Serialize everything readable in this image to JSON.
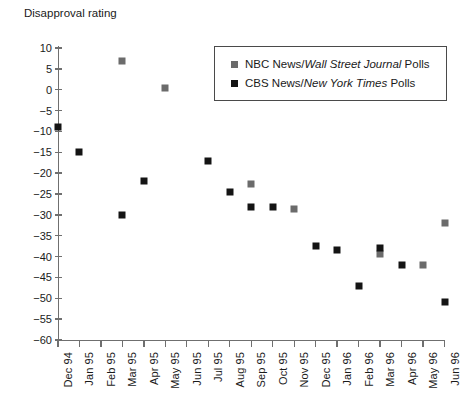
{
  "chart_data": {
    "type": "scatter",
    "title": "Disapproval rating",
    "xlabel": "",
    "ylabel": "Disapproval rating",
    "ylim": [
      -60,
      10
    ],
    "ytick_step": 5,
    "yticks": [
      10,
      5,
      0,
      -5,
      -10,
      -15,
      -20,
      -25,
      -30,
      -35,
      -40,
      -45,
      -50,
      -55,
      -60
    ],
    "ytick_labels": [
      "10",
      "5",
      "0",
      "−5",
      "−10",
      "−15",
      "−20",
      "−25",
      "−30",
      "−35",
      "−40",
      "−45",
      "−50",
      "−55",
      "−60"
    ],
    "categories": [
      "Dec 94",
      "Jan 95",
      "Feb 95",
      "Mar 95",
      "Apr 95",
      "May 95",
      "Jun 95",
      "Jul 95",
      "Aug 95",
      "Sep 95",
      "Oct 95",
      "Nov 95",
      "Dec 95",
      "Jan 96",
      "Feb 96",
      "Mar 96",
      "Apr 96",
      "May 96",
      "Jun 96"
    ],
    "grid": false,
    "legend_position": "top-right",
    "series": [
      {
        "name": "NBC News/Wall Street Journal Polls",
        "key": "nbc",
        "color": "#6b6b6b",
        "marker": "square",
        "points": [
          {
            "x": "Mar 95",
            "y": 7
          },
          {
            "x": "May 95",
            "y": 0.5
          },
          {
            "x": "Sep 95",
            "y": -22.5
          },
          {
            "x": "Nov 95",
            "y": -28.5
          },
          {
            "x": "Mar 96",
            "y": -39.5
          },
          {
            "x": "May 96",
            "y": -42
          },
          {
            "x": "Jun 96",
            "y": -32
          }
        ]
      },
      {
        "name": "CBS News/New York Times Polls",
        "key": "cbs",
        "color": "#141414",
        "marker": "square",
        "points": [
          {
            "x": "Dec 94",
            "y": -9
          },
          {
            "x": "Jan 95",
            "y": -15
          },
          {
            "x": "Mar 95",
            "y": -30
          },
          {
            "x": "Apr 95",
            "y": -22
          },
          {
            "x": "Jul 95",
            "y": -17
          },
          {
            "x": "Aug 95",
            "y": -24.5
          },
          {
            "x": "Sep 95",
            "y": -28
          },
          {
            "x": "Oct 95",
            "y": -28
          },
          {
            "x": "Dec 95",
            "y": -37.5
          },
          {
            "x": "Jan 96",
            "y": -38.5
          },
          {
            "x": "Feb 96",
            "y": -47
          },
          {
            "x": "Mar 96",
            "y": -38
          },
          {
            "x": "Apr 96",
            "y": -42
          },
          {
            "x": "Jun 96",
            "y": -51
          }
        ]
      }
    ]
  },
  "legend": {
    "entries": [
      {
        "key": "nbc",
        "prefix": "NBC News/",
        "italic": "Wall Street Journal",
        "suffix": " Polls"
      },
      {
        "key": "cbs",
        "prefix": "CBS News/",
        "italic": "New York Times",
        "suffix": " Polls"
      }
    ]
  },
  "colors": {
    "nbc_marker": "#6b6b6b",
    "cbs_marker": "#141414",
    "axis": "#6f6f6f",
    "text": "#1a1a1a",
    "background": "#ffffff"
  }
}
